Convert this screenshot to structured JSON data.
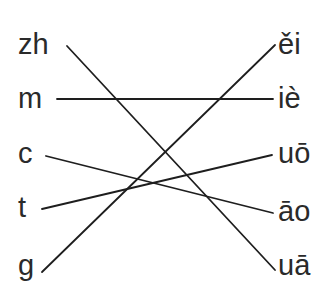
{
  "diagram": {
    "type": "matching-exercise",
    "left_items": [
      {
        "id": "zh",
        "label": "zh"
      },
      {
        "id": "m",
        "label": "m"
      },
      {
        "id": "c",
        "label": "c"
      },
      {
        "id": "t",
        "label": "t"
      },
      {
        "id": "g",
        "label": "g"
      }
    ],
    "right_items": [
      {
        "id": "ei3",
        "label": "ěi"
      },
      {
        "id": "ie4",
        "label": "iè"
      },
      {
        "id": "uo1",
        "label": "uō"
      },
      {
        "id": "ao1",
        "label": "āo"
      },
      {
        "id": "ua1",
        "label": "uā"
      }
    ],
    "connections": [
      {
        "from": "zh",
        "to": "uā"
      },
      {
        "from": "m",
        "to": "iè"
      },
      {
        "from": "c",
        "to": "āo"
      },
      {
        "from": "t",
        "to": "uō"
      },
      {
        "from": "g",
        "to": "ěi"
      }
    ],
    "line_color": "#1e1e1e",
    "text_color": "#2a2a2a"
  }
}
